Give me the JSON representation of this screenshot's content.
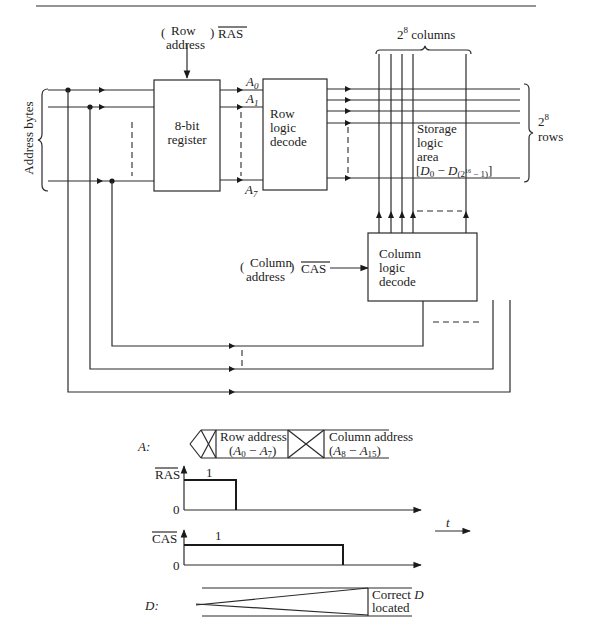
{
  "diagram": {
    "block_diagram": {
      "input_bus_label": "Address bytes",
      "row_address_label_line1": "Row",
      "row_address_label_line2": "address",
      "ras_label": "RAS",
      "register_label_line1": "8-bit",
      "register_label_line2": "register",
      "register_outputs": [
        "A0",
        "A1",
        "A7"
      ],
      "row_decoder_label_line1": "Row",
      "row_decoder_label_line2": "logic",
      "row_decoder_label_line3": "decode",
      "columns_label_base": "2",
      "columns_label_exp": "8",
      "columns_label_text": "columns",
      "rows_label_base": "2",
      "rows_label_exp": "8",
      "rows_label_text": "rows",
      "storage_label_line1": "Storage",
      "storage_label_line2": "logic",
      "storage_label_line3": "area",
      "storage_range": "[D0 − D(2^16 − 1)]",
      "column_address_label_line1": "Column",
      "column_address_label_line2": "address",
      "cas_label": "CAS",
      "column_decoder_label_line1": "Column",
      "column_decoder_label_line2": "logic",
      "column_decoder_label_line3": "decode"
    },
    "timing_diagram": {
      "address_signal_label": "A:",
      "row_address_phase_line1": "Row address",
      "row_address_phase_line2": "(A0 − A7)",
      "column_address_phase_line1": "Column address",
      "column_address_phase_line2": "(A8 − A15)",
      "ras_signal_label": "RAS",
      "ras_high_label": "1",
      "ras_low_label": "0",
      "cas_signal_label": "CAS",
      "cas_high_label": "1",
      "cas_low_label": "0",
      "time_axis_label": "t",
      "data_signal_label": "D:",
      "data_result_line1": "Correct D",
      "data_result_line2": "located"
    }
  }
}
